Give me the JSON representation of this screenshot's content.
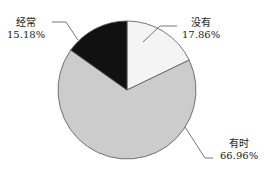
{
  "chart_data": {
    "type": "pie",
    "title": "",
    "categories": [
      "没有",
      "有时",
      "经常"
    ],
    "values": [
      17.86,
      66.96,
      15.18
    ],
    "labels": [
      "17.86%",
      "66.96%",
      "15.18%"
    ],
    "colors": [
      "#f4f4f4",
      "#cccccc",
      "#111111"
    ],
    "start_angle": "12 o'clock, clockwise",
    "legend": "none (callout labels)"
  },
  "labels": {
    "never": {
      "name": "没有",
      "pct": "17.86%"
    },
    "sometimes": {
      "name": "有时",
      "pct": "66.96%"
    },
    "often": {
      "name": "经常",
      "pct": "15.18%"
    }
  }
}
